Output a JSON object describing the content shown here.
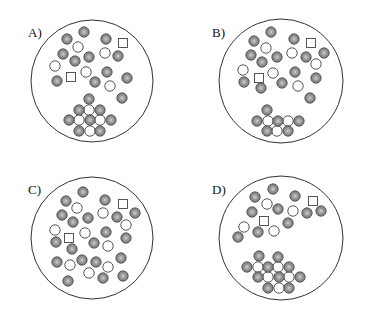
{
  "colors": {
    "outline": "#333333",
    "filled_fill": "#8a8a8a",
    "filled_center": "#c4c4c4",
    "filled_stroke": "#4a4a4a",
    "open_fill": "#ffffff",
    "open_stroke": "#444444",
    "square_stroke": "#444444"
  },
  "dot_radius": 5.2,
  "square_size": 9,
  "panels": [
    {
      "label": "A)",
      "label_pos": [
        28,
        37
      ],
      "circle": {
        "cx": 92,
        "cy": 81,
        "r": 61
      },
      "filled": [
        [
          84,
          32
        ],
        [
          67,
          39
        ],
        [
          106,
          39
        ],
        [
          63,
          54
        ],
        [
          89,
          57
        ],
        [
          118,
          56
        ],
        [
          75,
          61
        ],
        [
          107,
          72
        ],
        [
          127,
          78
        ],
        [
          57,
          81
        ],
        [
          95,
          82
        ],
        [
          122,
          98
        ],
        [
          89,
          99
        ],
        [
          79,
          110
        ],
        [
          100,
          110
        ],
        [
          69,
          120
        ],
        [
          90,
          120
        ],
        [
          111,
          120
        ],
        [
          79,
          131
        ],
        [
          100,
          131
        ]
      ],
      "open": [
        [
          78,
          47
        ],
        [
          105,
          53
        ],
        [
          55,
          66
        ],
        [
          86,
          72
        ],
        [
          110,
          86
        ],
        [
          89,
          110
        ],
        [
          79,
          120
        ],
        [
          100,
          120
        ],
        [
          90,
          131
        ]
      ],
      "squares": [
        [
          123,
          43
        ],
        [
          71,
          77
        ]
      ]
    },
    {
      "label": "B)",
      "label_pos": [
        212,
        37
      ],
      "circle": {
        "cx": 281,
        "cy": 81,
        "r": 62
      },
      "filled": [
        [
          271,
          32
        ],
        [
          254,
          41
        ],
        [
          294,
          39
        ],
        [
          324,
          53
        ],
        [
          251,
          55
        ],
        [
          306,
          57
        ],
        [
          277,
          57
        ],
        [
          262,
          62
        ],
        [
          295,
          72
        ],
        [
          316,
          78
        ],
        [
          244,
          82
        ],
        [
          282,
          83
        ],
        [
          261,
          88
        ],
        [
          310,
          98
        ],
        [
          267,
          110
        ],
        [
          257,
          121
        ],
        [
          278,
          121
        ],
        [
          299,
          121
        ],
        [
          267,
          131
        ],
        [
          288,
          131
        ]
      ],
      "open": [
        [
          266,
          48
        ],
        [
          292,
          53
        ],
        [
          316,
          64
        ],
        [
          243,
          70
        ],
        [
          273,
          73
        ],
        [
          298,
          86
        ],
        [
          268,
          121
        ],
        [
          288,
          121
        ],
        [
          277,
          131
        ]
      ],
      "squares": [
        [
          311,
          43
        ],
        [
          259,
          78
        ]
      ]
    },
    {
      "label": "C)",
      "label_pos": [
        28,
        194
      ],
      "circle": {
        "cx": 92,
        "cy": 238,
        "r": 61
      },
      "filled": [
        [
          83,
          192
        ],
        [
          66,
          201
        ],
        [
          105,
          200
        ],
        [
          135,
          213
        ],
        [
          62,
          215
        ],
        [
          117,
          217
        ],
        [
          88,
          218
        ],
        [
          73,
          222
        ],
        [
          106,
          232
        ],
        [
          126,
          238
        ],
        [
          56,
          242
        ],
        [
          94,
          243
        ],
        [
          72,
          249
        ],
        [
          57,
          262
        ],
        [
          82,
          260
        ],
        [
          96,
          262
        ],
        [
          121,
          258
        ],
        [
          103,
          278
        ],
        [
          123,
          276
        ],
        [
          68,
          281
        ]
      ],
      "open": [
        [
          77,
          208
        ],
        [
          103,
          213
        ],
        [
          126,
          225
        ],
        [
          55,
          230
        ],
        [
          85,
          233
        ],
        [
          108,
          246
        ],
        [
          70,
          265
        ],
        [
          108,
          267
        ],
        [
          89,
          273
        ]
      ],
      "squares": [
        [
          123,
          204
        ],
        [
          69,
          238
        ]
      ]
    },
    {
      "label": "D)",
      "label_pos": [
        212,
        194
      ],
      "circle": {
        "cx": 281,
        "cy": 238,
        "r": 62
      },
      "filled": [
        [
          273,
          189
        ],
        [
          255,
          197
        ],
        [
          295,
          196
        ],
        [
          252,
          212
        ],
        [
          278,
          209
        ],
        [
          307,
          213
        ],
        [
          321,
          211
        ],
        [
          288,
          223
        ],
        [
          258,
          232
        ],
        [
          238,
          237
        ],
        [
          259,
          256
        ],
        [
          278,
          257
        ],
        [
          247,
          267
        ],
        [
          268,
          267
        ],
        [
          289,
          267
        ],
        [
          258,
          277
        ],
        [
          279,
          277
        ],
        [
          300,
          277
        ],
        [
          268,
          288
        ],
        [
          289,
          288
        ]
      ],
      "open": [
        [
          267,
          204
        ],
        [
          293,
          211
        ],
        [
          244,
          227
        ],
        [
          274,
          231
        ],
        [
          258,
          267
        ],
        [
          278,
          267
        ],
        [
          268,
          277
        ],
        [
          289,
          277
        ],
        [
          279,
          288
        ]
      ],
      "squares": [
        [
          313,
          201
        ],
        [
          264,
          221
        ]
      ]
    }
  ]
}
